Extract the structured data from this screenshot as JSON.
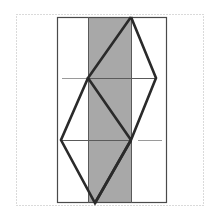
{
  "canvas": {
    "width": 217,
    "height": 216,
    "background": "#ffffff",
    "title": "Geometric line figure with shaded vertical band"
  },
  "colors": {
    "background": "#ffffff",
    "dotted_border": "#b4b4b4",
    "rectangle_stroke": "#4a4a4a",
    "band_fill": "#a8a8a8",
    "thick_line": "#2a2a2a",
    "thin_line": "#5a5a5a",
    "faint_line": "#9a9a9a"
  },
  "dotted_border": {
    "name": "dotted-frame",
    "x": 16,
    "y": 14,
    "width": 187,
    "height": 191,
    "stroke_width": 1,
    "dash": "1 2"
  },
  "rectangle": {
    "name": "outer-rectangle",
    "x": 57,
    "y": 17,
    "width": 110,
    "height": 186,
    "stroke_width": 1.2
  },
  "shaded_band": {
    "name": "shaded-vertical-band",
    "x": 88,
    "y": 17,
    "width": 43,
    "height": 186
  },
  "vertical_rules": [
    {
      "name": "band-left-edge",
      "x": 88,
      "y1": 17,
      "y2": 203
    },
    {
      "name": "band-right-edge",
      "x": 131,
      "y1": 17,
      "y2": 203
    }
  ],
  "horizontal_rules": [
    {
      "name": "upper-horizontal-rule",
      "x1": 88,
      "x2": 156,
      "y": 78
    },
    {
      "name": "lower-horizontal-rule",
      "x1": 61,
      "x2": 131,
      "y": 140
    }
  ],
  "faint_segments": [
    {
      "name": "faint-segment-left",
      "x1": 62,
      "x2": 87,
      "y": 78
    },
    {
      "name": "faint-segment-right",
      "x1": 138,
      "x2": 162,
      "y": 140
    }
  ],
  "vertices": {
    "top_apex": {
      "name": "top-apex",
      "x": 131,
      "y": 17
    },
    "upper_left": {
      "name": "upper-left-vertex",
      "x": 88,
      "y": 78
    },
    "upper_right": {
      "name": "upper-right-vertex",
      "x": 156,
      "y": 78
    },
    "lower_left": {
      "name": "lower-left-vertex",
      "x": 61,
      "y": 140
    },
    "lower_right": {
      "name": "lower-right-vertex",
      "x": 131,
      "y": 140
    },
    "bottom_apex": {
      "name": "bottom-apex",
      "x": 95,
      "y": 203
    }
  },
  "thick_polylines": [
    {
      "name": "upper-diamond-path",
      "points": "131,17 88,78 131,140 156,78 131,17",
      "stroke_width": 2.6
    },
    {
      "name": "lower-diamond-path",
      "points": "88,78 61,140 95,203 131,140",
      "stroke_width": 2.6
    },
    {
      "name": "bottom-apex-connector",
      "points": "95,203 131,140",
      "stroke_width": 2.6
    }
  ],
  "stroke_widths": {
    "thick": 2.6,
    "thin": 1.0,
    "faint": 1.0,
    "border": 1.0
  }
}
